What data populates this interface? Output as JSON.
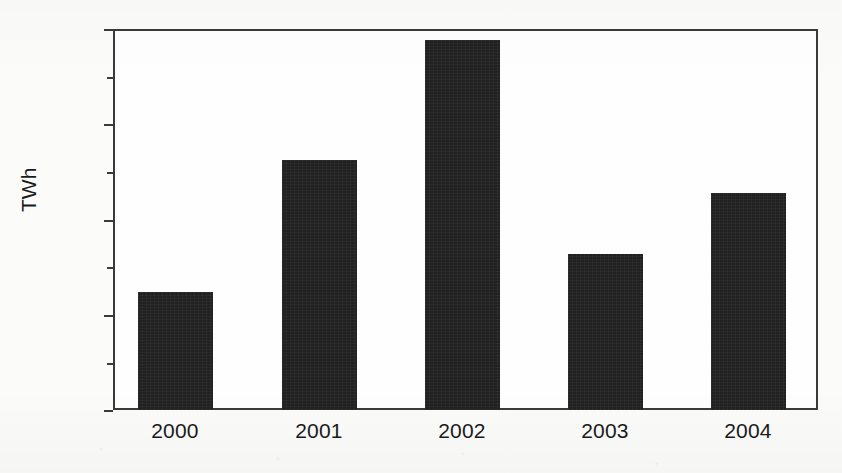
{
  "chart_data": {
    "type": "bar",
    "title": "",
    "xlabel": "",
    "ylabel": "TWh",
    "categories": [
      "2000",
      "2001",
      "2002",
      "2003",
      "2004"
    ],
    "values": [
      62,
      131,
      194,
      82,
      114
    ],
    "ylim": [
      0,
      200
    ],
    "ytick_labels": [
      "0",
      "50",
      "100",
      "150",
      "200"
    ],
    "ytick_values": [
      0,
      50,
      100,
      150,
      200
    ],
    "yminor_ticks": [
      25,
      75,
      125,
      175
    ],
    "grid": false,
    "legend": null,
    "bar_color": "#212121",
    "axis_color": "#3a3a3a",
    "background_color": "#fbfbfa"
  }
}
